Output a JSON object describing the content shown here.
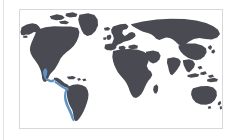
{
  "figure": {
    "type": "world-map",
    "title": "",
    "caption": "",
    "projection": "equirectangular",
    "frame": {
      "border_color": "#d8d8da",
      "background_color": "#ffffff",
      "x": 19,
      "y": 9,
      "width": 204,
      "height": 120
    },
    "left_rule_color": "#e3e3e5"
  },
  "map_data": {
    "type": "choropleth-highlight",
    "land_color": "#4a4a52",
    "ocean_color": "#ffffff",
    "highlight_color": "#5f92c4",
    "highlight_label": "Eastern Pacific coastal zone",
    "highlighted_regions": [
      "Mexico (Pacific coast)",
      "Guatemala",
      "El Salvador",
      "Nicaragua",
      "Costa Rica",
      "Panama",
      "Colombia (Pacific coast)",
      "Ecuador",
      "Peru",
      "Chile (northern coast)"
    ],
    "legend": {
      "visible": false,
      "entries": []
    },
    "labels": {
      "visible": false,
      "entries": []
    },
    "graticule": false,
    "lon_range": [
      -180,
      180
    ],
    "lat_range": [
      -60,
      84
    ]
  }
}
